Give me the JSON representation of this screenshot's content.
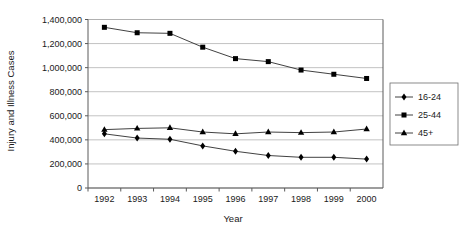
{
  "chart_data": {
    "type": "line",
    "title": "",
    "xlabel": "Year",
    "ylabel": "Injury and Illness Cases",
    "categories": [
      "1992",
      "1993",
      "1994",
      "1995",
      "1996",
      "1997",
      "1998",
      "1999",
      "2000"
    ],
    "x": [
      1992,
      1993,
      1994,
      1995,
      1996,
      1997,
      1998,
      1999,
      2000
    ],
    "ylim": [
      0,
      1400000
    ],
    "yticks": [
      0,
      200000,
      400000,
      600000,
      800000,
      1000000,
      1200000,
      1400000
    ],
    "ytick_labels": [
      "0",
      "200,000",
      "400,000",
      "600,000",
      "800,000",
      "1,000,000",
      "1,200,000",
      "1,400,000"
    ],
    "xtick_labels": [
      "1992",
      "1993",
      "1994",
      "1995",
      "1996",
      "1997",
      "1998",
      "1999",
      "2000"
    ],
    "grid": true,
    "grid_axis": "y",
    "legend_position": "right",
    "series": [
      {
        "name": "16-24",
        "marker": "diamond",
        "color": "#000000",
        "values": [
          450000,
          415000,
          405000,
          350000,
          305000,
          270000,
          255000,
          255000,
          240000
        ]
      },
      {
        "name": "25-44",
        "marker": "square",
        "color": "#000000",
        "values": [
          1335000,
          1290000,
          1285000,
          1170000,
          1075000,
          1050000,
          980000,
          945000,
          910000
        ]
      },
      {
        "name": "45+",
        "marker": "triangle",
        "color": "#000000",
        "values": [
          485000,
          495000,
          500000,
          465000,
          450000,
          465000,
          460000,
          465000,
          490000
        ]
      }
    ]
  },
  "legend": {
    "entries": [
      {
        "label": "16-24",
        "marker": "diamond"
      },
      {
        "label": "25-44",
        "marker": "square"
      },
      {
        "label": "45+",
        "marker": "triangle"
      }
    ]
  },
  "axes": {
    "y_title": "Injury and Illness Cases",
    "x_title": "Year"
  },
  "colors": {
    "ink": "#000000",
    "grid": "#a8a8a8",
    "axis": "#5a5a5a",
    "background": "#ffffff"
  }
}
